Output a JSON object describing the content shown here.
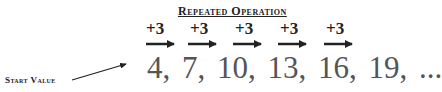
{
  "diagram": {
    "title": "Repeated Operation",
    "operations": [
      "+3",
      "+3",
      "+3",
      "+3",
      "+3"
    ],
    "sequence": "4,  7,  10,  13,  16,  19,  ...",
    "sequence_values": [
      4,
      7,
      10,
      13,
      16,
      19
    ],
    "continuation": "...",
    "start_label": "Start Value"
  }
}
